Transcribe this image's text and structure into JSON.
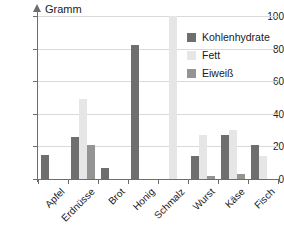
{
  "chart_data": {
    "type": "bar",
    "title": "",
    "xlabel": "",
    "ylabel": "Gramm",
    "ylim": [
      0,
      100
    ],
    "yticks": [
      0,
      20,
      40,
      60,
      80,
      100
    ],
    "grid": true,
    "legend_position": "top-right",
    "categories": [
      "Apfel",
      "Erdnüsse",
      "Brot",
      "Honig",
      "Schmalz",
      "Wurst",
      "Käse",
      "Fisch"
    ],
    "series": [
      {
        "name": "Kohlenhydrate",
        "color": "#6e6e6e",
        "values": [
          15,
          26,
          7,
          82,
          0,
          10,
          0,
          0
        ]
      },
      {
        "name": "Fett",
        "color": "#e6e6e6",
        "values": [
          0,
          49,
          0,
          0,
          100,
          27,
          30,
          0
        ]
      },
      {
        "name": "Eiweiß",
        "color": "#949494",
        "values": [
          0,
          21,
          0,
          0,
          0,
          1.5,
          2.5,
          0
        ]
      }
    ],
    "groups": [
      {
        "category": "Apfel",
        "bars": [
          {
            "series": "Kohlenhydrate",
            "value": 15
          },
          {
            "series": "Fett",
            "value": 0
          },
          {
            "series": "Eiweiß",
            "value": 0
          }
        ]
      },
      {
        "category": "Erdnüsse",
        "bars": [
          {
            "series": "Kohlenhydrate",
            "value": 26
          },
          {
            "series": "Fett",
            "value": 49
          },
          {
            "series": "Eiweiß",
            "value": 21
          }
        ]
      },
      {
        "category": "Brot",
        "bars": [
          {
            "series": "Kohlenhydrate",
            "value": 7
          },
          {
            "series": "Fett",
            "value": 0
          },
          {
            "series": "Eiweiß",
            "value": 0
          }
        ]
      },
      {
        "category": "Honig",
        "bars": [
          {
            "series": "Kohlenhydrate",
            "value": 82
          },
          {
            "series": "Fett",
            "value": 0
          },
          {
            "series": "Eiweiß",
            "value": 0
          }
        ]
      },
      {
        "category": "Schmalz",
        "bars": [
          {
            "series": "Kohlenhydrate",
            "value": 0
          },
          {
            "series": "Fett",
            "value": 100
          },
          {
            "series": "Eiweiß",
            "value": 0
          }
        ]
      },
      {
        "category": "Wurst",
        "bars": [
          {
            "series": "Kohlenhydrate",
            "value": 14
          },
          {
            "series": "Fett",
            "value": 27
          },
          {
            "series": "Eiweiß",
            "value": 2
          }
        ]
      },
      {
        "category": "Käse",
        "bars": [
          {
            "series": "Kohlenhydrate",
            "value": 27
          },
          {
            "series": "Fett",
            "value": 30
          },
          {
            "series": "Eiweiß",
            "value": 3
          }
        ]
      },
      {
        "category": "Fisch",
        "bars": [
          {
            "series": "Kohlenhydrate",
            "value": 21
          },
          {
            "series": "Fett",
            "value": 14
          },
          {
            "series": "Eiweiß",
            "value": 0
          }
        ]
      }
    ]
  },
  "axis": {
    "y_title": "Gramm",
    "y_tick_labels": [
      "0",
      "20",
      "40",
      "60",
      "80",
      "100"
    ]
  },
  "legend": {
    "items": [
      {
        "label": "Kohlenhydrate",
        "color": "#6e6e6e"
      },
      {
        "label": "Fett",
        "color": "#e6e6e6"
      },
      {
        "label": "Eiweiß",
        "color": "#949494"
      }
    ]
  }
}
